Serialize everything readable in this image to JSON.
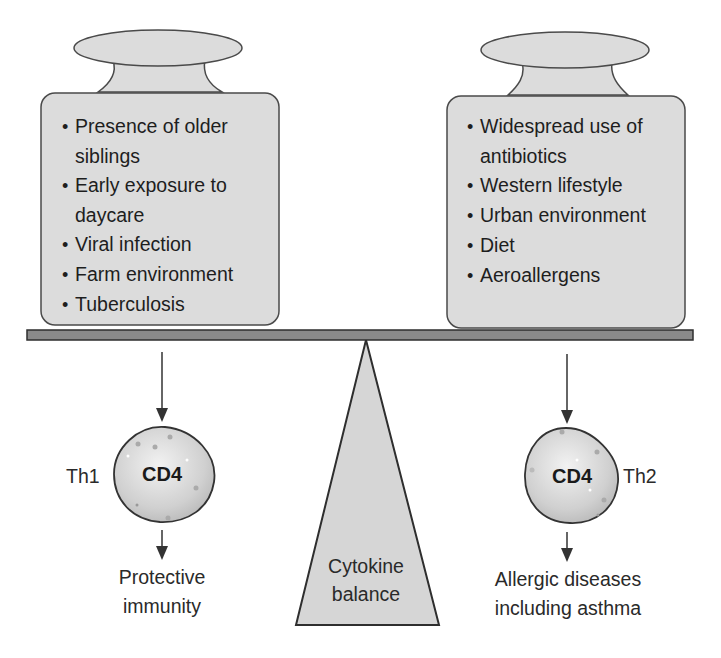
{
  "left_weight": {
    "items": [
      "Presence of older siblings",
      "Early exposure to daycare",
      "Viral infection",
      "Farm environment",
      "Tuberculosis"
    ]
  },
  "right_weight": {
    "items": [
      "Widespread use of antibiotics",
      "Western lifestyle",
      "Urban environment",
      "Diet",
      "Aeroallergens"
    ]
  },
  "left_cell": {
    "type_label": "Th1",
    "cell_label": "CD4",
    "outcome_line1": "Protective",
    "outcome_line2": "immunity"
  },
  "right_cell": {
    "type_label": "Th2",
    "cell_label": "CD4",
    "outcome_line1": "Allergic diseases",
    "outcome_line2": "including asthma"
  },
  "fulcrum": {
    "line1": "Cytokine",
    "line2": "balance"
  },
  "colors": {
    "weight_fill": "#dcdcdc",
    "beam_fill": "#8a8a8a",
    "outline": "#3a3a3a",
    "fulcrum_fill": "#d6d6d6"
  }
}
